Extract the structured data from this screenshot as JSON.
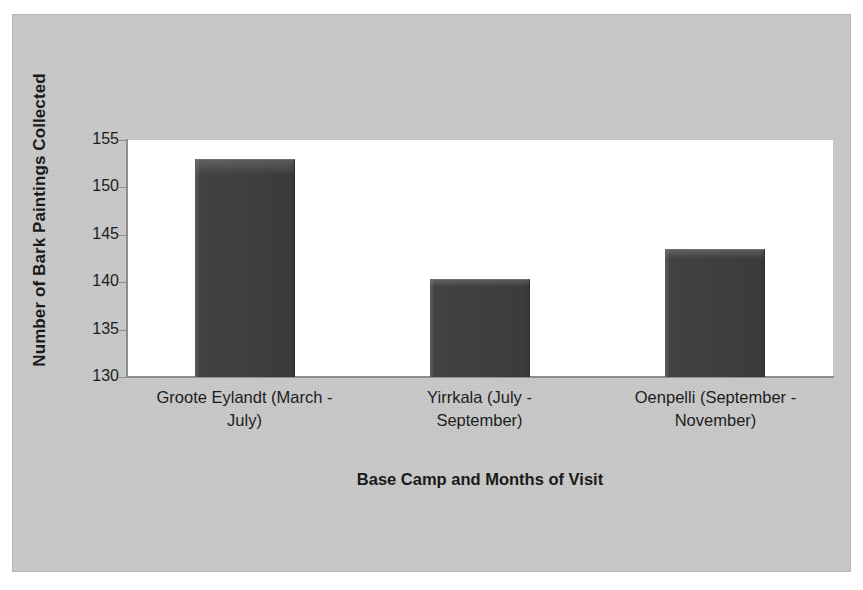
{
  "chart_data": {
    "type": "bar",
    "title": "",
    "xlabel": "Base Camp and Months of Visit",
    "ylabel": "Number of Bark Paintings Collected",
    "categories": [
      "Groote Eylandt (March - July)",
      "Yirrkala (July - September)",
      "Oenpelli (September - November)"
    ],
    "category_lines": [
      [
        "Groote Eylandt (March -",
        "July)"
      ],
      [
        "Yirrkala (July -",
        "September)"
      ],
      [
        "Oenpelli (September -",
        "November)"
      ]
    ],
    "values": [
      153,
      140.3,
      143.5
    ],
    "ylim": [
      130,
      155
    ],
    "yticks": [
      155,
      150,
      145,
      140,
      135,
      130
    ],
    "ytick_labels": [
      "155",
      "150",
      "145",
      "140",
      "135",
      "130"
    ],
    "grid": false,
    "legend": false,
    "bar_color": "#424244",
    "plot_background": "#ffffff",
    "figure_background": "#c9c9c9",
    "axis_color": "#8d8d8d",
    "text_color": "#1d1d1d"
  }
}
